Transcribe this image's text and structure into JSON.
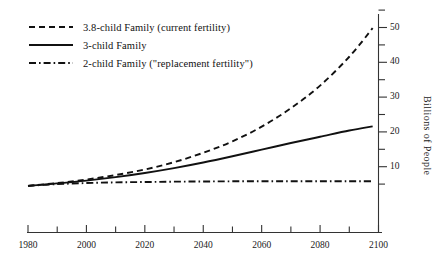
{
  "chart_data": {
    "type": "line",
    "title": "",
    "subtitle": "",
    "xlabel": "",
    "ylabel": "Billions of People",
    "xlim": [
      1980,
      2100
    ],
    "ylim": [
      0,
      55
    ],
    "grid": false,
    "legend_position": "top-left",
    "x_ticks_major": [
      "1980",
      "2000",
      "2020",
      "2040",
      "2060",
      "2080",
      "2100"
    ],
    "x_ticks_major_values": [
      1980,
      2000,
      2020,
      2040,
      2060,
      2080,
      2100
    ],
    "x_ticks_minor_values": [
      1990,
      2010,
      2030,
      2050,
      2070,
      2090
    ],
    "y_ticks_major": [
      "10",
      "20",
      "30",
      "40",
      "50"
    ],
    "y_ticks_major_values": [
      10,
      20,
      30,
      40,
      50
    ],
    "y_ticks_minor_values": [
      5,
      15,
      25,
      35,
      45,
      55
    ],
    "series": [
      {
        "name": "3.8-child Family (current fertility)",
        "style": "dashed",
        "x": [
          1980,
          1990,
          2000,
          2010,
          2020,
          2030,
          2040,
          2050,
          2060,
          2070,
          2080,
          2090,
          2098
        ],
        "values": [
          4.5,
          5.3,
          6.3,
          7.6,
          9.2,
          11.3,
          14.0,
          17.3,
          21.5,
          26.8,
          33.3,
          41.6,
          49.8
        ]
      },
      {
        "name": "3-child Family",
        "style": "solid",
        "x": [
          1980,
          1990,
          2000,
          2010,
          2020,
          2030,
          2040,
          2050,
          2060,
          2070,
          2080,
          2090,
          2098
        ],
        "values": [
          4.5,
          5.2,
          6.0,
          7.0,
          8.2,
          9.6,
          11.2,
          13.0,
          14.9,
          16.8,
          18.6,
          20.4,
          21.6
        ]
      },
      {
        "name": "2-child Family (\"replacement fertility\")",
        "style": "dash-dot",
        "x": [
          1980,
          1990,
          2000,
          2010,
          2020,
          2030,
          2040,
          2050,
          2060,
          2070,
          2080,
          2090,
          2098
        ],
        "values": [
          4.5,
          5.0,
          5.3,
          5.5,
          5.6,
          5.7,
          5.75,
          5.8,
          5.8,
          5.8,
          5.8,
          5.8,
          5.8
        ]
      }
    ]
  },
  "legend": {
    "items": [
      {
        "label": "3.8-child Family (current fertility)",
        "key": "dashed"
      },
      {
        "label": "3-child Family",
        "key": "solid"
      },
      {
        "label": "2-child Family (\"replacement fertility\")",
        "key": "dash-dot"
      }
    ]
  },
  "axes": {
    "y_title": "Billions of People",
    "y_labels": [
      "50",
      "40",
      "30",
      "20",
      "10"
    ],
    "x_labels": [
      "1980",
      "2000",
      "2020",
      "2040",
      "2060",
      "2080",
      "2100"
    ]
  },
  "colors": {
    "ink": "#111111",
    "background": "#ffffff",
    "axis": "#333333"
  }
}
